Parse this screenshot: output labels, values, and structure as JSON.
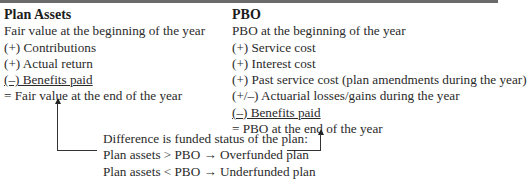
{
  "plan_assets": {
    "heading": "Plan Assets",
    "lines": [
      "Fair value at the beginning of the year",
      "(+) Contributions",
      "(+) Actual return",
      "(–) Benefits paid",
      "= Fair value at the end of the year"
    ]
  },
  "pbo": {
    "heading": "PBO",
    "lines": [
      "PBO at the beginning of the year",
      "(+) Service cost",
      "(+) Interest cost",
      "(+) Past service cost (plan amendments during the year)",
      "(+/–) Actuarial losses/gains during the year",
      "(–) Benefits paid",
      "= PBO at the end of the year"
    ]
  },
  "note": {
    "lines": [
      "Difference is funded status of the plan:",
      "Plan assets > PBO → Overfunded plan",
      "Plan assets < PBO → Underfunded plan"
    ]
  }
}
